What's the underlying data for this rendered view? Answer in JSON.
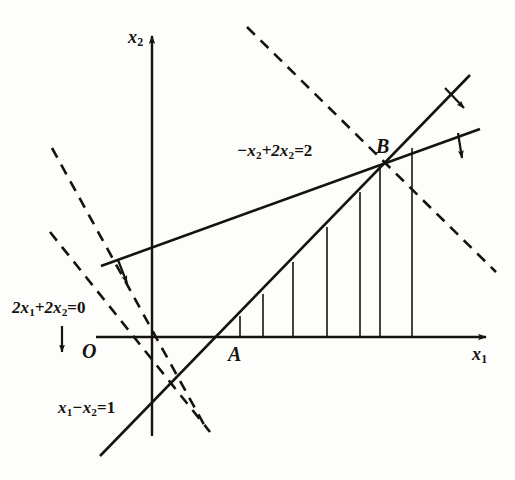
{
  "figure": {
    "background_color": "#fdfdfb",
    "ink_color": "#16130f"
  },
  "axes": {
    "x_axis_label": "x",
    "x_axis_sub": "1",
    "y_axis_label": "x",
    "y_axis_sub": "2",
    "origin_label": "O",
    "x_axis": {
      "x1": 96,
      "y1": 337,
      "x2": 492,
      "y2": 337,
      "arrow": "right"
    },
    "y_axis": {
      "x1": 152,
      "y1": 436,
      "x2": 152,
      "y2": 30,
      "arrow": "up"
    }
  },
  "points": [
    {
      "name": "A",
      "label": "A",
      "x": 232,
      "y": 352,
      "vertex_x": 218,
      "vertex_y": 337
    },
    {
      "name": "B",
      "label": "B",
      "x": 379,
      "y": 150,
      "vertex_x": 382,
      "vertex_y": 165
    }
  ],
  "constraint_lines": [
    {
      "id": "line-minus-x1-plus-2x2",
      "label_main": "−x",
      "label_sub1": "2",
      "label_mid": "+2x",
      "label_sub2": "2",
      "label_tail": "=2",
      "full_label": "−x2+2x2=2",
      "label_x": 237,
      "label_y": 143,
      "style": "solid",
      "x1": 101,
      "y1": 266,
      "x2": 480,
      "y2": 129,
      "arrow_on_line": {
        "at_x": 117,
        "at_y": 260,
        "direction": "down"
      },
      "arrow_at_end": {
        "at_x": 452,
        "at_y": 134,
        "direction": "down"
      }
    },
    {
      "id": "line-x1-minus-x2",
      "label_main": "x",
      "label_sub1": "1",
      "label_mid": "−x",
      "label_sub2": "2",
      "label_tail": "=1",
      "full_label": "x1−x2=1",
      "label_x": 58,
      "label_y": 400,
      "style": "solid",
      "x1": 100,
      "y1": 456,
      "x2": 470,
      "y2": 75,
      "arrow_at_end": {
        "at_x": 447,
        "at_y": 88,
        "direction": "down"
      }
    },
    {
      "id": "line-2x1-plus-2x2",
      "label_main": "2x",
      "label_sub1": "1",
      "label_mid": "+2x",
      "label_sub2": "2",
      "label_tail": "=0",
      "full_label": "2x1+2x2=0",
      "label_x": 12,
      "label_y": 300,
      "style": "dashed",
      "x1": 50,
      "y1": 232,
      "x2": 210,
      "y2": 432,
      "arrow_marker": {
        "at_x": 62,
        "at_y": 334,
        "direction": "down"
      }
    }
  ],
  "objective_dashed_lines": [
    {
      "id": "objective-dashed-upper",
      "style": "dashed",
      "x1": 247,
      "y1": 27,
      "x2": 496,
      "y2": 272
    },
    {
      "id": "objective-dashed-lower",
      "style": "dashed",
      "x1": 52,
      "y1": 148,
      "x2": 207,
      "y2": 430
    }
  ],
  "hatching": {
    "description": "vertical hatch lines filling feasible region between x1-x2=1 and -x1+2x2=2 above x1-axis",
    "baseline_y": 337,
    "lines": [
      {
        "x": 240,
        "y_top": 316
      },
      {
        "x": 263,
        "y_top": 294
      },
      {
        "x": 293,
        "y_top": 262
      },
      {
        "x": 327,
        "y_top": 227
      },
      {
        "x": 360,
        "y_top": 192
      },
      {
        "x": 380,
        "y_top": 168
      },
      {
        "x": 412,
        "y_top": 148
      }
    ]
  }
}
